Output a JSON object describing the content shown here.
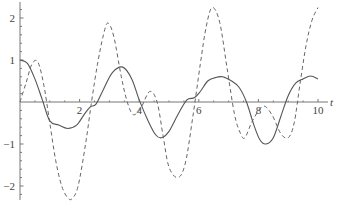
{
  "chart_data": {
    "type": "line",
    "title": "",
    "xlabel": "t",
    "ylabel": "",
    "xlim": [
      0,
      10
    ],
    "ylim": [
      -2.35,
      2.3
    ],
    "grid": false,
    "legend": null,
    "x_ticks": [
      2,
      4,
      6,
      8,
      10
    ],
    "x_tick_labels": [
      "2",
      "4",
      "6",
      "8",
      "10"
    ],
    "y_ticks": [
      2,
      1,
      -1,
      -2
    ],
    "y_tick_labels": [
      "2",
      "1",
      "−1",
      "−2"
    ],
    "series": [
      {
        "name": "solid",
        "style": "solid",
        "color": "#555555",
        "x": [
          0,
          0.25,
          0.5,
          0.75,
          1.0,
          1.3,
          1.6,
          1.9,
          2.15,
          2.35,
          2.55,
          2.8,
          3.1,
          3.45,
          3.75,
          4.0,
          4.3,
          4.55,
          4.75,
          5.0,
          5.3,
          5.6,
          5.85,
          6.05,
          6.3,
          6.55,
          6.8,
          7.1,
          7.35,
          7.6,
          7.85,
          8.05,
          8.25,
          8.5,
          8.75,
          9.0,
          9.25,
          9.5,
          9.75,
          10.0
        ],
        "y": [
          1.0,
          0.92,
          0.55,
          0.05,
          -0.45,
          -0.55,
          -0.63,
          -0.55,
          -0.3,
          -0.12,
          -0.05,
          0.3,
          0.7,
          0.83,
          0.55,
          0.05,
          -0.45,
          -0.78,
          -0.85,
          -0.7,
          -0.3,
          0.05,
          0.1,
          0.25,
          0.5,
          0.58,
          0.6,
          0.5,
          0.35,
          0.0,
          -0.55,
          -0.9,
          -1.0,
          -0.85,
          -0.35,
          0.15,
          0.45,
          0.55,
          0.62,
          0.55
        ]
      },
      {
        "name": "dashed",
        "style": "dashed",
        "color": "#666666",
        "x": [
          0,
          0.2,
          0.4,
          0.6,
          0.8,
          1.0,
          1.2,
          1.4,
          1.6,
          1.75,
          1.95,
          2.2,
          2.4,
          2.6,
          2.8,
          2.95,
          3.15,
          3.4,
          3.6,
          3.8,
          4.05,
          4.35,
          4.6,
          4.8,
          5.0,
          5.3,
          5.55,
          5.8,
          6.05,
          6.25,
          6.45,
          6.7,
          6.95,
          7.2,
          7.4,
          7.55,
          7.8,
          8.15,
          8.45,
          8.75,
          9.0,
          9.2,
          9.4,
          9.6,
          9.8,
          10.0
        ],
        "y": [
          0.0,
          0.45,
          0.9,
          0.95,
          0.4,
          -0.5,
          -1.4,
          -2.0,
          -2.28,
          -2.3,
          -2.0,
          -1.0,
          0.0,
          0.9,
          1.6,
          1.88,
          1.55,
          0.6,
          0.0,
          -0.3,
          -0.15,
          0.25,
          0.0,
          -0.8,
          -1.55,
          -1.8,
          -1.45,
          -0.35,
          0.9,
          1.8,
          2.25,
          1.9,
          0.8,
          -0.3,
          -0.75,
          -0.85,
          -0.45,
          -0.1,
          -0.3,
          -0.75,
          -0.85,
          -0.5,
          0.45,
          1.35,
          1.95,
          2.25
        ]
      }
    ]
  }
}
